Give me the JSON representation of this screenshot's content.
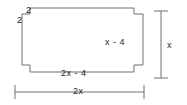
{
  "figure": {
    "stroke_color": "#6d6e71",
    "text_color": "#231f20",
    "background": "#ffffff",
    "labels": {
      "notch_top": "2",
      "notch_left": "2",
      "right_side": "x - 4",
      "bottom_side": "2x - 4",
      "overall_height": "x",
      "overall_width": "2x"
    },
    "shape": {
      "description": "Rectangle with square notches removed at all four corners",
      "outline_points": "22,14 30,14 30,8 134,8 134,14 143,14 143,65 134,65 134,72 30,72 30,65 22,65"
    },
    "dimension_lines": {
      "vertical": {
        "x": 161,
        "y_top": 11,
        "y_bottom": 78,
        "cap_half_width": 7
      },
      "horizontal": {
        "y": 92,
        "x_left": 15,
        "x_right": 144,
        "cap_half_height": 7
      }
    }
  }
}
